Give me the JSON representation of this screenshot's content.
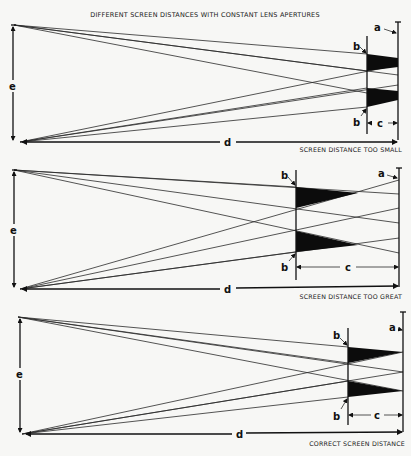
{
  "title": "DIFFERENT SCREEN DISTANCES WITH CONSTANT LENS APERTURES",
  "panels": [
    {
      "caption": "SCREEN DISTANCE TOO SMALL",
      "labels": {
        "a": "a",
        "b_top": "b",
        "b_bottom": "b",
        "c": "c",
        "d": "d",
        "e": "e"
      }
    },
    {
      "caption": "SCREEN DISTANCE TOO GREAT",
      "labels": {
        "a": "a",
        "b_top": "b",
        "b_bottom": "b",
        "c": "c",
        "d": "d",
        "e": "e"
      }
    },
    {
      "caption": "CORRECT SCREEN DISTANCE",
      "labels": {
        "a": "a",
        "b_top": "b",
        "b_bottom": "b",
        "c": "c",
        "d": "d",
        "e": "e"
      }
    }
  ],
  "colors": {
    "ink": "#111111",
    "paper": "#f7f7f5"
  }
}
